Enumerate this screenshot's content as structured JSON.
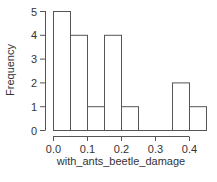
{
  "chart_data": {
    "type": "bar",
    "title": "",
    "xlabel": "with_ants_beetle_damage",
    "ylabel": "Frequency",
    "bins": [
      {
        "start": 0.0,
        "end": 0.05,
        "count": 5
      },
      {
        "start": 0.05,
        "end": 0.1,
        "count": 4
      },
      {
        "start": 0.1,
        "end": 0.15,
        "count": 1
      },
      {
        "start": 0.15,
        "end": 0.2,
        "count": 4
      },
      {
        "start": 0.2,
        "end": 0.25,
        "count": 1
      },
      {
        "start": 0.25,
        "end": 0.3,
        "count": 0
      },
      {
        "start": 0.3,
        "end": 0.35,
        "count": 0
      },
      {
        "start": 0.35,
        "end": 0.4,
        "count": 2
      },
      {
        "start": 0.4,
        "end": 0.45,
        "count": 1
      }
    ],
    "categories": [
      "0.00-0.05",
      "0.05-0.10",
      "0.10-0.15",
      "0.15-0.20",
      "0.20-0.25",
      "0.25-0.30",
      "0.30-0.35",
      "0.35-0.40",
      "0.40-0.45"
    ],
    "values": [
      5,
      4,
      1,
      4,
      1,
      0,
      0,
      2,
      1
    ],
    "xticks": [
      "0.0",
      "0.1",
      "0.2",
      "0.3",
      "0.4"
    ],
    "yticks": [
      "0",
      "1",
      "2",
      "3",
      "4",
      "5"
    ],
    "xlim": [
      0.0,
      0.45
    ],
    "ylim": [
      0,
      5
    ],
    "grid": false,
    "legend": null
  }
}
